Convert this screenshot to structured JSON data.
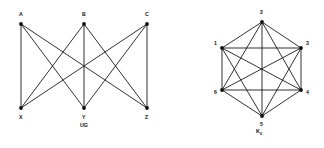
{
  "figure": {
    "width": 324,
    "height": 148,
    "background": "#ffffff",
    "ink_color": "#1a1a1a"
  },
  "graphs": [
    {
      "id": "ug",
      "caption": "UG",
      "caption_subscript": "",
      "type": "complete-bipartite",
      "notation": "K3,3",
      "caption_pos": {
        "x": 84,
        "y": 127
      },
      "vertices": [
        {
          "id": "A",
          "label": "A",
          "x": 21,
          "y": 24,
          "label_x": 19,
          "label_y": 16,
          "part": "top"
        },
        {
          "id": "B",
          "label": "B",
          "x": 84,
          "y": 24,
          "label_x": 82,
          "label_y": 16,
          "part": "top"
        },
        {
          "id": "C",
          "label": "C",
          "x": 147,
          "y": 24,
          "label_x": 145,
          "label_y": 16,
          "part": "top"
        },
        {
          "id": "X",
          "label": "X",
          "x": 21,
          "y": 108,
          "label_x": 19,
          "label_y": 119,
          "part": "bottom"
        },
        {
          "id": "Y",
          "label": "Y",
          "x": 84,
          "y": 108,
          "label_x": 82,
          "label_y": 119,
          "part": "bottom"
        },
        {
          "id": "Z",
          "label": "Z",
          "x": 147,
          "y": 108,
          "label_x": 145,
          "label_y": 119,
          "part": "bottom"
        }
      ],
      "edges": [
        [
          "A",
          "X"
        ],
        [
          "A",
          "Y"
        ],
        [
          "A",
          "Z"
        ],
        [
          "B",
          "X"
        ],
        [
          "B",
          "Y"
        ],
        [
          "B",
          "Z"
        ],
        [
          "C",
          "X"
        ],
        [
          "C",
          "Y"
        ],
        [
          "C",
          "Z"
        ]
      ],
      "edge_count": 9,
      "vertex_count": 6
    },
    {
      "id": "k6",
      "caption": "K",
      "caption_subscript": "6",
      "type": "complete",
      "notation": "K6",
      "caption_pos": {
        "x": 259,
        "y": 133
      },
      "vertices": [
        {
          "id": "1",
          "label": "1",
          "x": 222,
          "y": 48,
          "label_x": 214,
          "label_y": 45
        },
        {
          "id": "2",
          "label": "2",
          "x": 262,
          "y": 22,
          "label_x": 260,
          "label_y": 14
        },
        {
          "id": "3",
          "label": "3",
          "x": 301,
          "y": 48,
          "label_x": 306,
          "label_y": 45
        },
        {
          "id": "4",
          "label": "4",
          "x": 301,
          "y": 90,
          "label_x": 306,
          "label_y": 94
        },
        {
          "id": "5",
          "label": "5",
          "x": 262,
          "y": 116,
          "label_x": 260,
          "label_y": 126
        },
        {
          "id": "6",
          "label": "6",
          "x": 222,
          "y": 90,
          "label_x": 214,
          "label_y": 94
        }
      ],
      "edges": [
        [
          "1",
          "2"
        ],
        [
          "1",
          "3"
        ],
        [
          "1",
          "4"
        ],
        [
          "1",
          "5"
        ],
        [
          "1",
          "6"
        ],
        [
          "2",
          "3"
        ],
        [
          "2",
          "4"
        ],
        [
          "2",
          "5"
        ],
        [
          "2",
          "6"
        ],
        [
          "3",
          "4"
        ],
        [
          "3",
          "5"
        ],
        [
          "3",
          "6"
        ],
        [
          "4",
          "5"
        ],
        [
          "4",
          "6"
        ],
        [
          "5",
          "6"
        ]
      ],
      "edge_count": 15,
      "vertex_count": 6
    }
  ]
}
